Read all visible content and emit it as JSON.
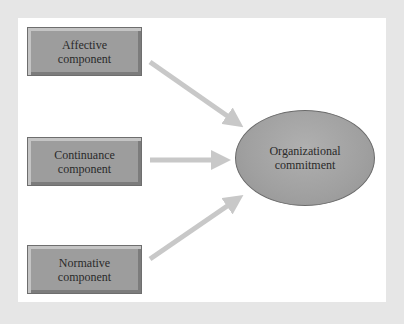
{
  "diagram": {
    "sources": [
      {
        "id": "affective",
        "line1": "Affective",
        "line2": "component"
      },
      {
        "id": "continuance",
        "line1": "Continuance",
        "line2": "component"
      },
      {
        "id": "normative",
        "line1": "Normative",
        "line2": "component"
      }
    ],
    "target": {
      "line1": "Organizational",
      "line2": "commitment"
    },
    "colors": {
      "frame": "#e6e6e6",
      "panel": "#ffffff",
      "box_fill": "#9d9d9d",
      "ellipse_fill": "#a3a3a3",
      "arrow": "#c8c8c8"
    }
  }
}
